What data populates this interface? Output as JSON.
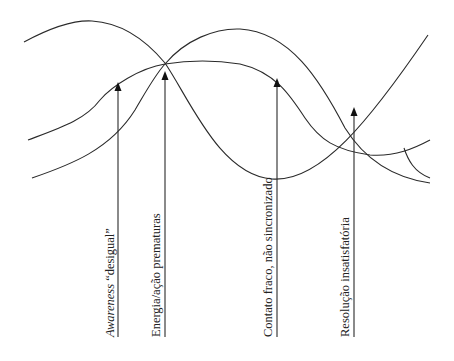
{
  "diagram": {
    "type": "process-curves",
    "curves": [
      {
        "id": "curve-1",
        "description": "starts upper-left, peaks, descends to valley near center-right, rises steeply at right"
      },
      {
        "id": "curve-2",
        "description": "rises from left to a plateau in the middle, descends, then flattens rising slightly at right"
      },
      {
        "id": "curve-3",
        "description": "rises from lower-left to peak mid-right, descends to lower-right"
      },
      {
        "id": "branch",
        "description": "short branch splitting downward at the right end"
      }
    ],
    "arrows": [
      {
        "id": "arrow-1",
        "label_italic": "Awareness",
        "label_rest": " “desigual”"
      },
      {
        "id": "arrow-2",
        "label_italic": "",
        "label_rest": "Energia/ação prematuras"
      },
      {
        "id": "arrow-3",
        "label_italic": "",
        "label_rest": "Contato fraco, não sincronizado"
      },
      {
        "id": "arrow-4",
        "label_italic": "",
        "label_rest": "Resolução insatisfatória"
      }
    ]
  }
}
